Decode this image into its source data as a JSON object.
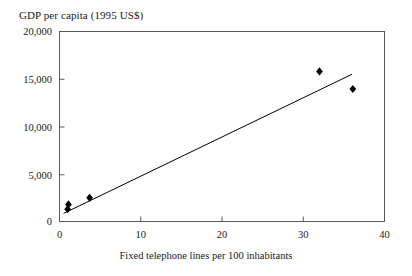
{
  "chart_data": {
    "type": "scatter",
    "title": "GDP per capita (1995 US$)",
    "xlabel": "Fixed telephone lines per 100 inhabitants",
    "ylabel": "GDP per capita (1995 US$)",
    "xlim": [
      0,
      40
    ],
    "ylim": [
      0,
      20000
    ],
    "xticks": [
      0,
      10,
      20,
      30,
      40
    ],
    "yticks": [
      0,
      5000,
      10000,
      15000,
      20000
    ],
    "xtick_labels": [
      "0",
      "10",
      "20",
      "30",
      "40"
    ],
    "ytick_labels": [
      "0",
      "5,000",
      "10,000",
      "15,000",
      "20,000"
    ],
    "grid": false,
    "legend": false,
    "marker": "diamond",
    "marker_color": "#000000",
    "line_color": "#000000",
    "frame_color": "#4a4a4a",
    "points": [
      {
        "x": 1.0,
        "y": 1300
      },
      {
        "x": 1.1,
        "y": 1800
      },
      {
        "x": 3.7,
        "y": 2500
      },
      {
        "x": 32.0,
        "y": 15800
      },
      {
        "x": 36.1,
        "y": 13950
      }
    ],
    "series": [
      {
        "name": "observations",
        "x": [
          1.0,
          1.1,
          3.7,
          32.0,
          36.1
        ],
        "values": [
          1300,
          1800,
          2500,
          15800,
          13950
        ]
      }
    ],
    "trendline": {
      "type": "linear",
      "x": [
        0.5,
        36.0
      ],
      "y": [
        850,
        15500
      ]
    }
  },
  "axis": {
    "y_labels": [
      "20,000",
      "15,000",
      "10,000",
      "5,000",
      "0"
    ],
    "x_labels": [
      "0",
      "10",
      "20",
      "30",
      "40"
    ]
  }
}
